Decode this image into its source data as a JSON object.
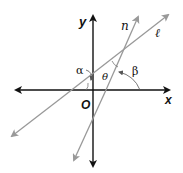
{
  "diagram": {
    "axes": {
      "x_label": "x",
      "y_label": "y",
      "origin_label": "O"
    },
    "lines": [
      {
        "name": "line-l",
        "label": "ℓ",
        "color": "#999999"
      },
      {
        "name": "line-n",
        "label": "n",
        "color": "#999999"
      }
    ],
    "angles": [
      {
        "name": "alpha",
        "label": "α"
      },
      {
        "name": "theta",
        "label": "θ"
      },
      {
        "name": "beta",
        "label": "β"
      }
    ],
    "colors": {
      "axis": "#111111",
      "line": "#999999",
      "background": "#ffffff"
    }
  }
}
